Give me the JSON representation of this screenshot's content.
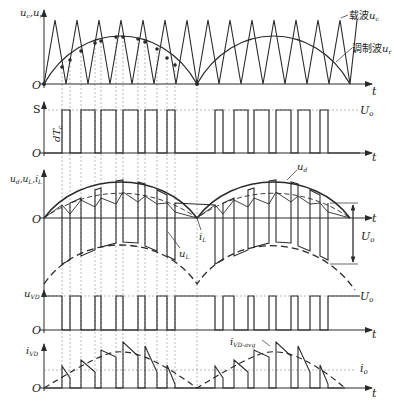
{
  "diagram": {
    "type": "PWM inverter/rectifier waveforms (SPWM)",
    "colors": {
      "line": "#2a2a2a",
      "grid": "#888888",
      "background": "#ffffff"
    },
    "panels": [
      {
        "id": "carrier-modulation",
        "y_label": "u_c, u_r",
        "origin_label": "O",
        "t_label": "t",
        "annotations": {
          "carrier": "载波u_c",
          "modulation": "调制波u_r"
        }
      },
      {
        "id": "switch-signal",
        "y_label": "S",
        "origin_label": "O",
        "t_label": "t",
        "pulse_width_label": "dT_c",
        "level_label": "U_o"
      },
      {
        "id": "voltages-current",
        "y_label": "u_d, u_L, i_L",
        "origin_label": "O",
        "t_label": "t",
        "annotations": {
          "ud": "u_d",
          "uL": "u_L",
          "iL": "i_L",
          "Uo": "U_o"
        }
      },
      {
        "id": "diode-voltage",
        "y_label": "u_VD",
        "origin_label": "O",
        "t_label": "t",
        "level_label": "U_o"
      },
      {
        "id": "diode-current",
        "y_label": "i_VD",
        "origin_label": "O",
        "t_label": "t",
        "annotations": {
          "avg": "i_VD-avg",
          "io": "i_o"
        }
      }
    ]
  },
  "labels": {
    "p1_y_u": "u",
    "p1_y_sub1": "c",
    "p1_y_sep": ",u",
    "p1_y_sub2": "r",
    "O": "O",
    "t": "t",
    "S": "S",
    "carrier_cn": "载波",
    "carrier_u": "u",
    "carrier_sub": "c",
    "mod_cn": "调制波",
    "mod_u": "u",
    "mod_sub": "r",
    "dT": "dT",
    "dT_sub": "c",
    "Uo": "U",
    "Uo_sub": "o",
    "p3_y": "u",
    "p3_y_sub1": "d",
    "p3_y_sep1": ",u",
    "p3_y_sub2": "L",
    "p3_y_sep2": ",i",
    "p3_y_sub3": "L",
    "ud": "u",
    "ud_sub": "d",
    "uL": "u",
    "uL_sub": "L",
    "iL": "i",
    "iL_sub": "L",
    "uVD": "u",
    "uVD_sub": "VD",
    "iVD": "i",
    "iVD_sub": "VD",
    "iavg": "i",
    "iavg_sub": "VD-avg",
    "io": "i",
    "io_sub": "o"
  }
}
